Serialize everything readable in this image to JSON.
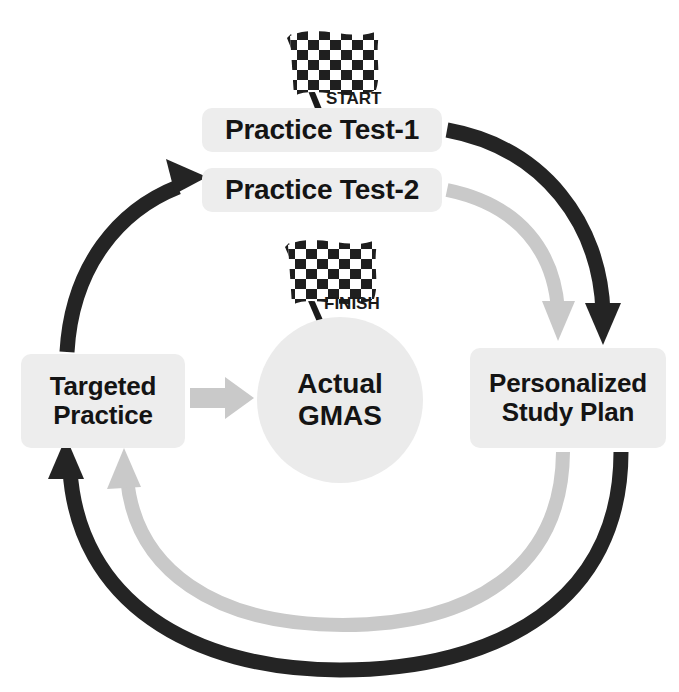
{
  "diagram": {
    "colors": {
      "dark_arrow": "#242424",
      "light_arrow": "#c9c9c9",
      "chip_background": "#ededed",
      "circle_background": "#ebebeb",
      "text": "#141414",
      "page_background": "#ffffff"
    }
  },
  "nodes": {
    "practice_test_1": {
      "label": "Practice Test-1"
    },
    "practice_test_2": {
      "label": "Practice Test-2"
    },
    "targeted_practice": {
      "line1": "Targeted",
      "line2": "Practice"
    },
    "actual_gmas": {
      "line1": "Actual",
      "line2": "GMAS"
    },
    "personalized_study_plan": {
      "line1": "Personalized",
      "line2": "Study Plan"
    }
  },
  "flags": {
    "start": {
      "label": "START",
      "icon": "checkered-flag-icon"
    },
    "finish": {
      "label": "FINISH",
      "icon": "checkered-flag-icon"
    }
  },
  "connectors": [
    {
      "name": "test1-to-plan",
      "from": "Practice Test-1",
      "to": "Personalized Study Plan",
      "color": "#242424",
      "style": "curved-arc-right-outer"
    },
    {
      "name": "test2-to-plan",
      "from": "Practice Test-2",
      "to": "Personalized Study Plan",
      "color": "#c9c9c9",
      "style": "curved-arc-right-inner"
    },
    {
      "name": "plan-to-targeted-dark",
      "from": "Personalized Study Plan",
      "to": "Targeted Practice",
      "color": "#242424",
      "style": "curved-arc-bottom-outer"
    },
    {
      "name": "plan-to-targeted-light",
      "from": "Personalized Study Plan",
      "to": "Targeted Practice",
      "color": "#c9c9c9",
      "style": "curved-arc-bottom-inner"
    },
    {
      "name": "targeted-to-test2",
      "from": "Targeted Practice",
      "to": "Practice Test-2",
      "color": "#242424",
      "style": "curved-arc-left"
    },
    {
      "name": "targeted-to-gmas",
      "from": "Targeted Practice",
      "to": "Actual GMAS",
      "color": "#c9c9c9",
      "style": "straight-block-arrow"
    }
  ]
}
